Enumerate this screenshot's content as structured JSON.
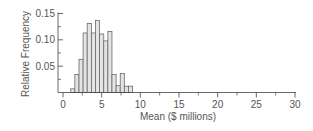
{
  "chart_data": {
    "type": "bar",
    "subtype": "histogram",
    "title": "",
    "xlabel": "Mean ($ millions)",
    "ylabel": "Relative Frequency",
    "xlim": [
      0,
      30
    ],
    "ylim": [
      0,
      0.15
    ],
    "xticks": [
      0,
      5,
      10,
      15,
      20,
      25,
      30
    ],
    "xtick_labels": [
      "0",
      "5",
      "10",
      "15",
      "20",
      "25",
      "30"
    ],
    "x_minor_ticks": [
      2.5,
      7.5,
      12.5,
      17.5,
      22.5,
      27.5
    ],
    "yticks": [
      0.05,
      0.1,
      0.15
    ],
    "ytick_labels": [
      "0.05",
      "0.10",
      "0.15"
    ],
    "y_minor_ticks": [
      0.025,
      0.075,
      0.125
    ],
    "grid": false,
    "legend": null,
    "bin_start": 1.0,
    "bin_width": 0.533,
    "bins": [
      {
        "x0": 1.0,
        "x1": 1.53,
        "value": 0.007
      },
      {
        "x0": 1.53,
        "x1": 2.07,
        "value": 0.034
      },
      {
        "x0": 2.07,
        "x1": 2.6,
        "value": 0.063
      },
      {
        "x0": 2.6,
        "x1": 3.13,
        "value": 0.113
      },
      {
        "x0": 3.13,
        "x1": 3.67,
        "value": 0.131
      },
      {
        "x0": 3.67,
        "x1": 4.2,
        "value": 0.113
      },
      {
        "x0": 4.2,
        "x1": 4.73,
        "value": 0.137
      },
      {
        "x0": 4.73,
        "x1": 5.27,
        "value": 0.111
      },
      {
        "x0": 5.27,
        "x1": 5.8,
        "value": 0.098
      },
      {
        "x0": 5.8,
        "x1": 6.33,
        "value": 0.116
      },
      {
        "x0": 6.33,
        "x1": 6.87,
        "value": 0.034
      },
      {
        "x0": 6.87,
        "x1": 7.4,
        "value": 0.013
      },
      {
        "x0": 7.4,
        "x1": 7.93,
        "value": 0.036
      },
      {
        "x0": 7.93,
        "x1": 8.47,
        "value": 0.012
      },
      {
        "x0": 8.47,
        "x1": 9.0,
        "value": 0.012
      }
    ],
    "colors": {
      "bar_fill": "#e4e4e4",
      "bar_stroke": "#6a6a6a",
      "axis": "#444444",
      "text": "#555555"
    }
  }
}
